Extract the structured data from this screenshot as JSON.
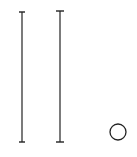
{
  "canvas": {
    "width": 137,
    "height": 157,
    "background": "#ffffff",
    "stroke": "#222222"
  },
  "elements": [
    {
      "type": "capped-line",
      "name": "left-vertical-bar",
      "x": 22,
      "y1": 12,
      "y2": 142,
      "cap_width": 6
    },
    {
      "type": "capped-line",
      "name": "right-vertical-bar",
      "x": 60,
      "y1": 11,
      "y2": 142,
      "cap_width": 8
    },
    {
      "type": "circle",
      "name": "small-circle",
      "cx": 118,
      "cy": 132,
      "r": 8
    }
  ]
}
